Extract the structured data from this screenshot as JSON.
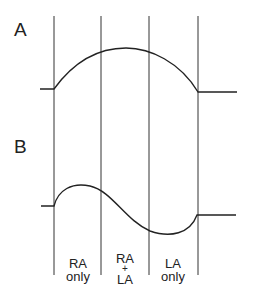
{
  "panels": {
    "a": {
      "label": "A"
    },
    "b": {
      "label": "B"
    }
  },
  "regions": [
    {
      "line1": "RA",
      "line2": "only",
      "line3": ""
    },
    {
      "line1": "RA",
      "line2": "+",
      "line3": "LA"
    },
    {
      "line1": "LA",
      "line2": "only",
      "line3": ""
    }
  ],
  "colors": {
    "line": "#333333",
    "background": "#ffffff"
  }
}
